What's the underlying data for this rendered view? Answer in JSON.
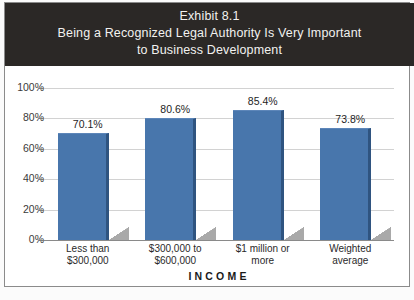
{
  "figure": {
    "title_lines": [
      "Exhibit 8.1",
      "Being a Recognized Legal Authority Is Very Important",
      "to Business Development"
    ],
    "banner_color": "#2b2826",
    "banner_text_color": "#f2f2f0"
  },
  "chart_data": {
    "type": "bar",
    "title": "Being a Recognized Legal Authority Is Very Important to Business Development",
    "exhibit": "Exhibit 8.1",
    "categories": [
      "Less than\n$300,000",
      "$300,000 to\n$600,000",
      "$1 million or\nmore",
      "Weighted\naverage"
    ],
    "category_lines": [
      [
        "Less than",
        "$300,000"
      ],
      [
        "$300,000 to",
        "$600,000"
      ],
      [
        "$1 million or",
        "more"
      ],
      [
        "Weighted",
        "average"
      ]
    ],
    "values": [
      70.1,
      80.6,
      85.4,
      73.8
    ],
    "value_labels": [
      "70.1%",
      "80.6%",
      "85.4%",
      "73.8%"
    ],
    "xlabel": "INCOME",
    "ylabel": "",
    "ylim": [
      0,
      100
    ],
    "ytick_labels": [
      "100%",
      "80%",
      "60%",
      "40%",
      "20%",
      "0%"
    ],
    "ytick_values": [
      100,
      80,
      60,
      40,
      20,
      0
    ],
    "grid": true,
    "legend": "none",
    "bar_color": "#4876ac",
    "bar_edge_color": "#2f5480",
    "gridline_color": "#d2d2d2"
  }
}
